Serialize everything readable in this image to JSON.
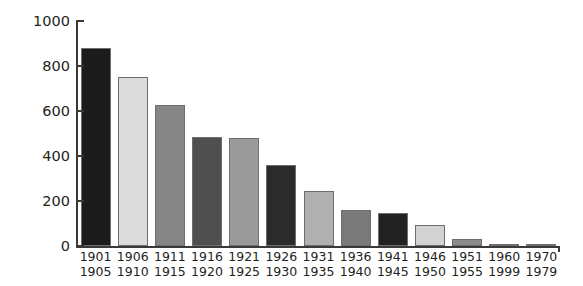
{
  "chart_data": {
    "type": "bar",
    "title": "",
    "subtitle": "",
    "xlabel": "",
    "ylabel": "",
    "ylim": [
      0,
      1000
    ],
    "yticks": [
      "0",
      "200",
      "400",
      "600",
      "800",
      "1000"
    ],
    "ytick_values": [
      0,
      200,
      400,
      600,
      800,
      1000
    ],
    "grid": false,
    "legend": "none",
    "categories": [
      "1901\n1905",
      "1906\n1910",
      "1911\n1915",
      "1916\n1920",
      "1921\n1925",
      "1926\n1930",
      "1931\n1935",
      "1936\n1940",
      "1941\n1945",
      "1946\n1950",
      "1951\n1955",
      "1960\n1999",
      "1970\n1979"
    ],
    "category_lines": [
      {
        "line1": "1901",
        "line2": "1905"
      },
      {
        "line1": "1906",
        "line2": "1910"
      },
      {
        "line1": "1911",
        "line2": "1915"
      },
      {
        "line1": "1916",
        "line2": "1920"
      },
      {
        "line1": "1921",
        "line2": "1925"
      },
      {
        "line1": "1926",
        "line2": "1930"
      },
      {
        "line1": "1931",
        "line2": "1935"
      },
      {
        "line1": "1936",
        "line2": "1940"
      },
      {
        "line1": "1941",
        "line2": "1945"
      },
      {
        "line1": "1946",
        "line2": "1950"
      },
      {
        "line1": "1951",
        "line2": "1955"
      },
      {
        "line1": "1960",
        "line2": "1999"
      },
      {
        "line1": "1970",
        "line2": "1979"
      }
    ],
    "values": [
      880,
      750,
      625,
      485,
      480,
      360,
      245,
      160,
      145,
      95,
      32,
      10,
      6
    ],
    "bar_colors": [
      "#1b1b1b",
      "#dcdcdc",
      "#868686",
      "#4f4f4f",
      "#9a9a9a",
      "#2b2b2b",
      "#b0b0b0",
      "#7a7a7a",
      "#222222",
      "#d2d2d2",
      "#8c8c8c",
      "#5a5a5a",
      "#a8a8a8"
    ],
    "bar_edge_color": "#6e6e6e",
    "axis_color": "#3a3a3a",
    "background_color": "#ffffff",
    "text_color": "#231f20"
  }
}
